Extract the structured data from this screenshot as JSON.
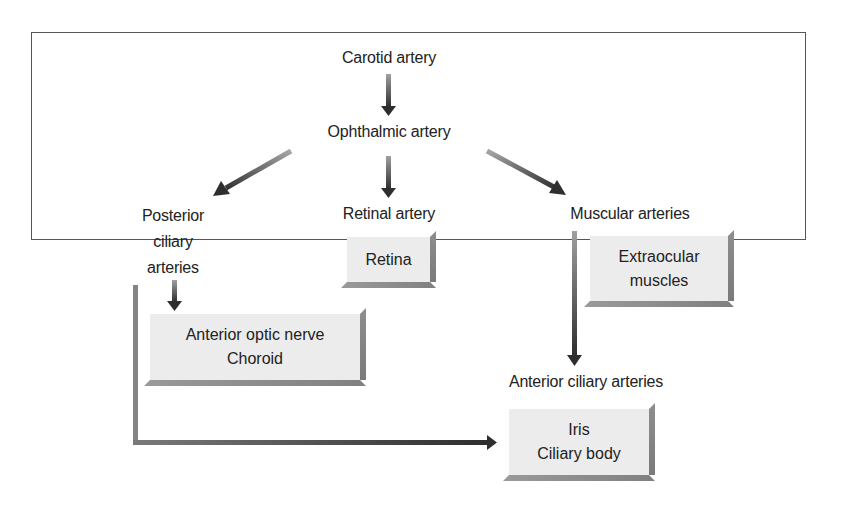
{
  "diagram": {
    "nodes": {
      "carotid": "Carotid artery",
      "ophthalmic": "Ophthalmic artery",
      "posterior_ciliary": [
        "Posterior",
        "ciliary",
        "arteries"
      ],
      "retinal_artery": "Retinal artery",
      "muscular_arteries": "Muscular arteries",
      "anterior_ciliary": "Anterior ciliary arteries"
    },
    "boxes": {
      "retina": [
        "Retina"
      ],
      "extraocular": [
        "Extraocular",
        "muscles"
      ],
      "optic_choroid": [
        "Anterior optic nerve",
        "Choroid"
      ],
      "iris_ciliary": [
        "Iris",
        "Ciliary body"
      ]
    },
    "edges": [
      {
        "from": "Carotid artery",
        "to": "Ophthalmic artery"
      },
      {
        "from": "Ophthalmic artery",
        "to": "Posterior ciliary arteries"
      },
      {
        "from": "Ophthalmic artery",
        "to": "Retinal artery"
      },
      {
        "from": "Ophthalmic artery",
        "to": "Muscular arteries"
      },
      {
        "from": "Posterior ciliary arteries",
        "to": "Anterior optic nerve / Choroid"
      },
      {
        "from": "Posterior ciliary arteries",
        "to": "Iris / Ciliary body"
      },
      {
        "from": "Muscular arteries",
        "to": "Anterior ciliary arteries"
      }
    ],
    "colors": {
      "border": "#555555",
      "box_fill": "#ececec",
      "box_shadow": "#858585",
      "arrow_light": "#9a9a9a",
      "arrow_dark": "#2e2e2e",
      "text": "#222222"
    }
  }
}
